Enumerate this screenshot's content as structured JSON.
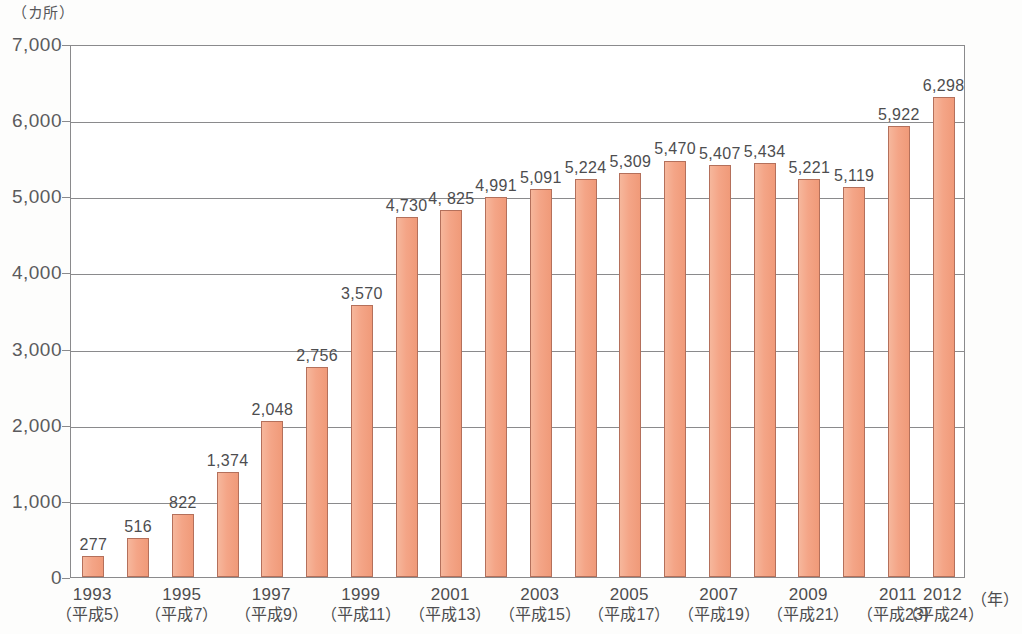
{
  "chart_data": {
    "type": "bar",
    "title": "",
    "unit_label": "（カ所）",
    "xlabel": "（年）",
    "ylabel": "",
    "ylim": [
      0,
      7000
    ],
    "ytick_labels": [
      "7,000",
      "6,000",
      "5,000",
      "4,000",
      "3,000",
      "2,000",
      "1,000",
      "0"
    ],
    "ytick_values": [
      7000,
      6000,
      5000,
      4000,
      3000,
      2000,
      1000,
      0
    ],
    "grid": true,
    "legend": "none",
    "bar_color": "#f4a587",
    "bar_border_color": "#b4705b",
    "categories": [
      "1993",
      "1994",
      "1995",
      "1996",
      "1997",
      "1998",
      "1999",
      "2000",
      "2001",
      "2002",
      "2003",
      "2004",
      "2005",
      "2006",
      "2007",
      "2008",
      "2009",
      "2010",
      "2011",
      "2012"
    ],
    "era_labels": [
      "（平成5）",
      "",
      "（平成7）",
      "",
      "（平成9）",
      "",
      "（平成11）",
      "",
      "（平成13）",
      "",
      "（平成15）",
      "",
      "（平成17）",
      "",
      "（平成19）",
      "",
      "（平成21）",
      "",
      "（平成23）",
      "（平成24）"
    ],
    "values": [
      277,
      516,
      822,
      1374,
      2048,
      2756,
      3570,
      4730,
      4825,
      4991,
      5091,
      5224,
      5309,
      5470,
      5407,
      5434,
      5221,
      5119,
      5922,
      6298
    ],
    "value_labels": [
      "277",
      "516",
      "822",
      "1,374",
      "2,048",
      "2,756",
      "3,570",
      "4,730",
      "4, 825",
      "4,991",
      "5,091",
      "5,224",
      "5,309",
      "5,470",
      "5,407",
      "5,434",
      "5,221",
      "5,119",
      "5,922",
      "6,298"
    ],
    "visible_xtick_indices": [
      0,
      2,
      4,
      6,
      8,
      10,
      12,
      14,
      16,
      18,
      19
    ],
    "visible_xtick_labels": [
      "1993",
      "1995",
      "1997",
      "1999",
      "2001",
      "2003",
      "2005",
      "2007",
      "2009",
      "2011",
      "2012"
    ],
    "visible_xtick_eras": [
      "（平成5）",
      "（平成7）",
      "（平成9）",
      "（平成11）",
      "（平成13）",
      "（平成15）",
      "（平成17）",
      "（平成19）",
      "（平成21）",
      "（平成23）",
      "（平成24）"
    ]
  }
}
